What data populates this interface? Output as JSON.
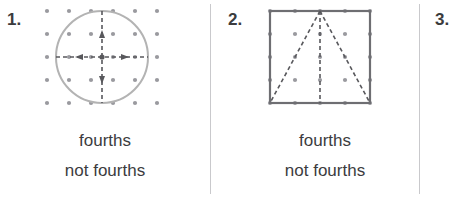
{
  "worksheet": {
    "background_color": "#ffffff",
    "divider_color": "#c9c9cc"
  },
  "problems": [
    {
      "number_label": "1.",
      "figure": {
        "shape": "circle",
        "shape_stroke_color": "#b3b3b3",
        "grid_dot_color": "#9a9a9f",
        "partition_line_color": "#58585c",
        "partition_line_style": "dashed",
        "partition_description": "vertical and horizontal dashed lines through center with arrowheads",
        "grid_columns": 6,
        "grid_rows": 5
      },
      "answers": [
        {
          "label": "fourths"
        },
        {
          "label": "not fourths"
        }
      ]
    },
    {
      "number_label": "2.",
      "figure": {
        "shape": "square",
        "shape_stroke_color": "#6e6e72",
        "grid_dot_color": "#9a9a9f",
        "partition_line_color": "#58585c",
        "partition_line_style": "dashed",
        "partition_description": "two dashed diagonals from top-center to bottom corners plus vertical dashed center line",
        "grid_columns": 5,
        "grid_rows": 5
      },
      "answers": [
        {
          "label": "fourths"
        },
        {
          "label": "not fourths"
        }
      ]
    },
    {
      "number_label": "3.",
      "figure": null,
      "answers": []
    }
  ]
}
